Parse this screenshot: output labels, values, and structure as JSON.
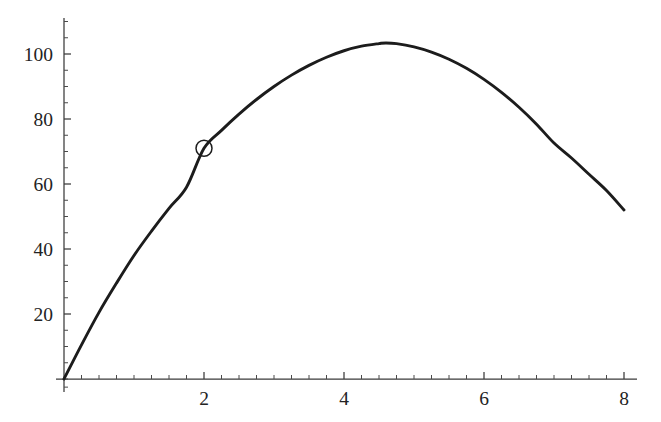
{
  "figure": {
    "kind": "function-plot",
    "background_color": "#ffffff",
    "curve_color": "#1c1c1c",
    "axis_color": "#3a3a3a",
    "label_color": "#232323",
    "width": 661,
    "height": 422
  },
  "geometry": {
    "origin_px": {
      "x": 64,
      "y": 379
    },
    "x_px_per_unit": 70.0,
    "y_px_per_unit": 3.25,
    "x_axis_px_range": [
      56,
      637
    ],
    "y_axis_px_range": [
      18,
      392
    ]
  },
  "axes": {
    "x_labels": [
      "2",
      "4",
      "6",
      "8"
    ],
    "x_label_values": [
      2,
      4,
      6,
      8
    ],
    "y_labels": [
      "20",
      "40",
      "60",
      "80",
      "100"
    ],
    "y_label_values": [
      20,
      40,
      60,
      80,
      100
    ],
    "x_minor_step": 0.25,
    "y_minor_step": 5,
    "grid": "off",
    "xlabel": "",
    "ylabel": "",
    "title": ""
  },
  "chart_data": {
    "type": "line",
    "title": "",
    "subtitle": "",
    "xlabel": "",
    "ylabel": "",
    "xlim": [
      0,
      8
    ],
    "ylim": [
      0,
      110
    ],
    "xticks": [
      2,
      4,
      6,
      8
    ],
    "yticks": [
      20,
      40,
      60,
      80,
      100
    ],
    "xtick_labels": [
      "2",
      "4",
      "6",
      "8"
    ],
    "ytick_labels": [
      "20",
      "40",
      "60",
      "80",
      "100"
    ],
    "grid": false,
    "legend": null,
    "legend_position": "none",
    "series": [
      {
        "name": "curve",
        "color": "#1c1c1c",
        "line_width": 2.9,
        "x": [
          0,
          0.25,
          0.5,
          0.75,
          1,
          1.25,
          1.5,
          1.75,
          2,
          2.25,
          2.5,
          2.75,
          3,
          3.25,
          3.5,
          3.75,
          4,
          4.25,
          4.5,
          4.6,
          4.75,
          5,
          5.25,
          5.5,
          5.75,
          6,
          6.25,
          6.5,
          6.75,
          7,
          7.25,
          7.5,
          7.75,
          8
        ],
        "y": [
          0,
          10.5,
          20.5,
          29.5,
          38,
          45.5,
          52.5,
          59,
          71,
          76.5,
          81.5,
          86,
          90,
          93.5,
          96.5,
          99,
          101,
          102.4,
          103.2,
          103.4,
          103.2,
          102.2,
          100.6,
          98.4,
          95.6,
          92.2,
          88.2,
          83.6,
          78.4,
          72.6,
          68,
          63,
          58,
          52
        ]
      }
    ],
    "markers": [
      {
        "name": "highlighted-point",
        "x": 2,
        "y": 71,
        "shape": "open-circle",
        "radius_px": 8,
        "stroke": "#1c1c1c",
        "fill": "none",
        "label": ""
      }
    ],
    "annotations": [
      {
        "name": "maximum",
        "x": 4.6,
        "y": 103.4,
        "label": ""
      }
    ]
  }
}
